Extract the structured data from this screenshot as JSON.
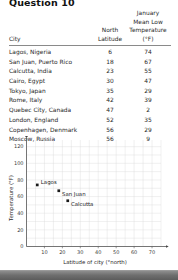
{
  "page": {
    "title": "Question 10"
  },
  "table": {
    "headers": {
      "city": "City",
      "latitude_line1": "North",
      "latitude_line2": "Latitude",
      "temperature_line1": "January",
      "temperature_line2": "Mean Low",
      "temperature_line3": "Temperature (°F)"
    },
    "rows": [
      {
        "city": "Lagos, Nigeria",
        "latitude": "6",
        "temperature": "74"
      },
      {
        "city": "San Juan, Puerto Rico",
        "latitude": "18",
        "temperature": "67"
      },
      {
        "city": "Calcutta, India",
        "latitude": "23",
        "temperature": "55"
      },
      {
        "city": "Cairo, Egypt",
        "latitude": "30",
        "temperature": "47"
      },
      {
        "city": "Tokyo, Japan",
        "latitude": "35",
        "temperature": "29"
      },
      {
        "city": "Rome, Italy",
        "latitude": "42",
        "temperature": "39"
      },
      {
        "city": "Quebec City, Canada",
        "latitude": "47",
        "temperature": "2"
      },
      {
        "city": "London, England",
        "latitude": "52",
        "temperature": "35"
      },
      {
        "city": "Copenhagen, Denmark",
        "latitude": "56",
        "temperature": "29"
      },
      {
        "city": "Moscow, Russia",
        "latitude": "56",
        "temperature": "9"
      }
    ]
  },
  "chart_data": {
    "type": "scatter",
    "title": "",
    "xlabel": "Latitude of city (°north)",
    "ylabel": "Temperature (°F)",
    "xlim": [
      0,
      75
    ],
    "ylim": [
      0,
      128
    ],
    "xticks": [
      10,
      20,
      30,
      40,
      50,
      60,
      70
    ],
    "yticks": [
      0,
      20,
      40,
      60,
      80,
      100,
      120
    ],
    "xtick_labels": [
      "10",
      "20",
      "30",
      "40",
      "50",
      "60",
      "70"
    ],
    "ytick_labels": [
      "0",
      "20",
      "40",
      "60",
      "80",
      "100",
      "120"
    ],
    "grid": true,
    "grid_color": "#d9d9d9",
    "axis_color": "#555555",
    "marker_color": "#1a1a1a",
    "legend": "none",
    "points": [
      {
        "label": "Lagos",
        "x": 6,
        "y": 74
      },
      {
        "label": "San Juan",
        "x": 18,
        "y": 67
      },
      {
        "label": "Calcutta",
        "x": 23,
        "y": 55
      }
    ]
  }
}
